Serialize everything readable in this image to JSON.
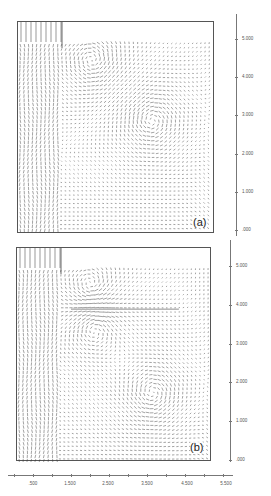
{
  "chart_data": [
    {
      "type": "vector_field",
      "panel_label": "(a)",
      "title": "",
      "y_ticks": [
        ".000",
        "1.000",
        "2.000",
        "3.000",
        "4.000",
        "5.000"
      ],
      "ylim": [
        0,
        5.6
      ],
      "features": {
        "inlet_region": "hatched vertical jets at left (x 0-1.1), top strip of vertical lines",
        "vortices": [
          {
            "x": 2.1,
            "y": 4.6,
            "rotation": "counterclockwise"
          },
          {
            "x": 3.8,
            "y": 3.0,
            "rotation": "clockwise"
          }
        ]
      }
    },
    {
      "type": "vector_field",
      "panel_label": "(b)",
      "title": "",
      "y_ticks": [
        ".000",
        "1.000",
        "2.000",
        "3.000",
        "4.000",
        "5.000"
      ],
      "x_ticks": [
        ".500",
        "1.500",
        "2.500",
        "3.500",
        "4.500",
        "5.500"
      ],
      "ylim": [
        0,
        5.6
      ],
      "features": {
        "inlet_region": "hatched vertical jets at left (x 0-1.1), top strip of vertical lines",
        "baffle_line_y": 4.0,
        "vortices": [
          {
            "x": 2.1,
            "y": 4.6,
            "rotation": "counterclockwise"
          },
          {
            "x": 2.2,
            "y": 3.5,
            "rotation": "clockwise"
          },
          {
            "x": 3.9,
            "y": 1.8,
            "rotation": "clockwise"
          }
        ]
      }
    }
  ],
  "panels": {
    "a": {
      "label": "(a)"
    },
    "b": {
      "label": "(b)"
    }
  },
  "axes": {
    "y_ticks": [
      ".000",
      "1.000",
      "2.000",
      "3.000",
      "4.000",
      "5.000"
    ],
    "x_ticks": [
      ".500",
      "1.500",
      "2.500",
      "3.500",
      "4.500",
      "5.500"
    ]
  },
  "colors": {
    "arrow": "#333333",
    "frame": "#555555"
  }
}
